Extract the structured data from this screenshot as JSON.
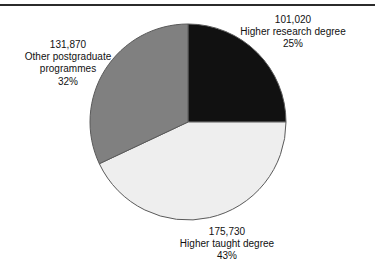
{
  "chart_data": {
    "type": "pie",
    "title": "",
    "subtitle": "",
    "xlabel": "",
    "ylabel": "",
    "legend_position": "none",
    "grid": false,
    "labels_outside": true,
    "total_value": 408620,
    "start_angle_deg": 0,
    "direction": "clockwise",
    "categories": [
      "Higher research degree",
      "Higher taught degree",
      "Other postgraduate programmes"
    ],
    "values": [
      101020,
      175730,
      131870
    ],
    "percentages": [
      25,
      43,
      32
    ],
    "colors": [
      "#111111",
      "#eeeeee",
      "#808080"
    ],
    "slices": [
      {
        "name": "Higher research degree",
        "value_label": "101,020",
        "value": 101020,
        "percent_label": "25%",
        "percent": 25,
        "color": "#111111",
        "label_position": "top-right"
      },
      {
        "name": "Higher taught degree",
        "value_label": "175,730",
        "value": 175730,
        "percent_label": "43%",
        "percent": 43,
        "color": "#eeeeee",
        "label_position": "bottom"
      },
      {
        "name": "Other postgraduate programmes",
        "value_label": "131,870",
        "value": 131870,
        "percent_label": "32%",
        "percent": 32,
        "color": "#808080",
        "label_position": "left"
      }
    ]
  },
  "labels": {
    "research": {
      "value": "101,020",
      "name": "Higher research degree",
      "percent": "25%"
    },
    "taught": {
      "value": "175,730",
      "name": "Higher taught degree",
      "percent": "43%"
    },
    "other": {
      "value": "131,870",
      "name_line1": "Other postgraduate",
      "name_line2": "programmes",
      "percent": "32%"
    }
  },
  "style": {
    "background": "#ffffff",
    "rule_color": "#2b2b2b",
    "slice_outline": "#5a5a5a",
    "text_color": "#111111"
  }
}
